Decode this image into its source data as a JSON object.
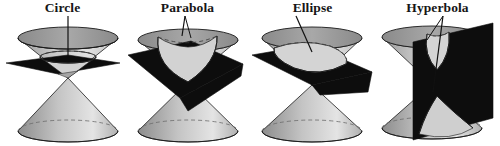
{
  "figure": {
    "width": 500,
    "height": 146,
    "background": "#ffffff"
  },
  "colors": {
    "outline": "#1a1a1a",
    "plane_dark": "#0d0d0d",
    "cone_light": "#d9d9d9",
    "cone_mid": "#b5b5b5",
    "cone_dark": "#8f8f8f",
    "cone_top_rim": "#9a9a9a",
    "label_text": "#161616",
    "leader_line": "#111111",
    "hidden_edge": "#6b6b6b"
  },
  "panels": [
    {
      "id": "circle",
      "label": "Circle",
      "description": "Plane perpendicular to the cone axis cuts the upper nappe in a circle",
      "plane_orientation": "horizontal",
      "leader": {
        "from_x": 68,
        "from_y": 16,
        "to_x": 68,
        "to_y": 52
      }
    },
    {
      "id": "parabola",
      "label": "Parabola",
      "description": "Plane parallel to one generating line cuts the upper nappe in a parabola",
      "plane_orientation": "tilted-parallel-to-side",
      "leader": {
        "from_x": 60,
        "from_y": 16,
        "to_x": 55,
        "to_y": 34
      }
    },
    {
      "id": "ellipse",
      "label": "Ellipse",
      "description": "Oblique plane cuts the upper nappe in an ellipse",
      "plane_orientation": "oblique",
      "leader": {
        "from_x": 48,
        "from_y": 16,
        "to_x": 62,
        "to_y": 49
      }
    },
    {
      "id": "hyperbola",
      "label": "Hyperbola",
      "description": "Plane parallel to the cone axis cuts both nappes in a hyperbola",
      "plane_orientation": "vertical",
      "leader": {
        "from_x": 68,
        "from_y": 16,
        "to_x": 60,
        "to_y": 90
      }
    }
  ]
}
